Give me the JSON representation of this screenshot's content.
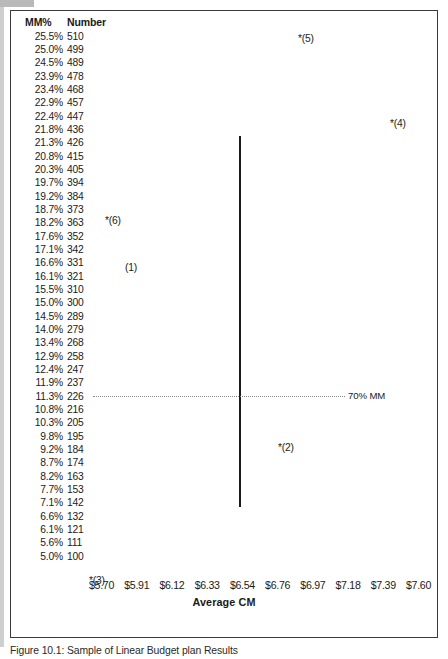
{
  "figure": {
    "caption": "Figure 10.1: Sample of Linear Budget plan Results",
    "axis": {
      "x_title": "Average CM",
      "x_ticks": [
        "$5.70",
        "$5.91",
        "$6.12",
        "$6.33",
        "$6.54",
        "$6.76",
        "$6.97",
        "$7.18",
        "$7.39",
        "$7.60"
      ],
      "x_min": 5.7,
      "x_max": 7.6
    },
    "reference_line": {
      "label": "70% MM",
      "at_mm_percent": "11.3%",
      "at_number": "226",
      "style": "dotted"
    },
    "range_bar": {
      "top_mm_percent": "21.3%",
      "top_number": "426",
      "bottom_mm_percent": "7.1%",
      "bottom_number": "142",
      "at_x_tick": "$6.54"
    }
  },
  "table": {
    "headers": {
      "mm_percent": "MM%",
      "number": "Number"
    },
    "rows": [
      {
        "mm": "25.5%",
        "num": "510"
      },
      {
        "mm": "25.0%",
        "num": "499"
      },
      {
        "mm": "24.5%",
        "num": "489"
      },
      {
        "mm": "23.9%",
        "num": "478"
      },
      {
        "mm": "23.4%",
        "num": "468"
      },
      {
        "mm": "22.9%",
        "num": "457"
      },
      {
        "mm": "22.4%",
        "num": "447"
      },
      {
        "mm": "21.8%",
        "num": "436"
      },
      {
        "mm": "21.3%",
        "num": "426"
      },
      {
        "mm": "20.8%",
        "num": "415"
      },
      {
        "mm": "20.3%",
        "num": "405"
      },
      {
        "mm": "19.7%",
        "num": "394"
      },
      {
        "mm": "19.2%",
        "num": "384"
      },
      {
        "mm": "18.7%",
        "num": "373"
      },
      {
        "mm": "18.2%",
        "num": "363"
      },
      {
        "mm": "17.6%",
        "num": "352"
      },
      {
        "mm": "17.1%",
        "num": "342"
      },
      {
        "mm": "16.6%",
        "num": "331"
      },
      {
        "mm": "16.1%",
        "num": "321"
      },
      {
        "mm": "15.5%",
        "num": "310"
      },
      {
        "mm": "15.0%",
        "num": "300"
      },
      {
        "mm": "14.5%",
        "num": "289"
      },
      {
        "mm": "14.0%",
        "num": "279"
      },
      {
        "mm": "13.4%",
        "num": "268"
      },
      {
        "mm": "12.9%",
        "num": "258"
      },
      {
        "mm": "12.4%",
        "num": "247"
      },
      {
        "mm": "11.9%",
        "num": "237"
      },
      {
        "mm": "11.3%",
        "num": "226"
      },
      {
        "mm": "10.8%",
        "num": "216"
      },
      {
        "mm": "10.3%",
        "num": "205"
      },
      {
        "mm": "9.8%",
        "num": "195"
      },
      {
        "mm": "9.2%",
        "num": "184"
      },
      {
        "mm": "8.7%",
        "num": "174"
      },
      {
        "mm": "8.2%",
        "num": "163"
      },
      {
        "mm": "7.7%",
        "num": "153"
      },
      {
        "mm": "7.1%",
        "num": "142"
      },
      {
        "mm": "6.6%",
        "num": "132"
      },
      {
        "mm": "6.1%",
        "num": "121"
      },
      {
        "mm": "5.6%",
        "num": "111"
      },
      {
        "mm": "5.0%",
        "num": "100"
      }
    ]
  },
  "markers": [
    {
      "id": "m5",
      "label": "*(5)",
      "x": 297,
      "y": 32,
      "mm": "25.5%",
      "num": "510"
    },
    {
      "id": "m4",
      "label": "*(4)",
      "x": 389,
      "y": 117,
      "mm": "22.4%",
      "num": "447"
    },
    {
      "id": "m6",
      "label": "*(6)",
      "x": 104,
      "y": 214,
      "mm": "18.7%",
      "num": "373"
    },
    {
      "id": "m1",
      "label": "(1)",
      "x": 124,
      "y": 261,
      "mm": "17.1%",
      "num": "342"
    },
    {
      "id": "m2",
      "label": "*(2)",
      "x": 277,
      "y": 441,
      "mm": "10.3%",
      "num": "205"
    },
    {
      "id": "m3",
      "label": "*(3)",
      "x": 88,
      "y": 574,
      "mm": "5.0%",
      "num": "100"
    }
  ],
  "chart_data": {
    "type": "scatter",
    "title": "",
    "xlabel": "Average CM",
    "ylabel": "MM% / Number",
    "xlim": [
      5.7,
      7.6
    ],
    "grid": false,
    "legend": null,
    "x_tick_labels": [
      "$5.70",
      "$5.91",
      "$6.12",
      "$6.33",
      "$6.54",
      "$6.76",
      "$6.97",
      "$7.18",
      "$7.39",
      "$7.60"
    ],
    "y_tick_labels_mm": [
      "25.5%",
      "25.0%",
      "24.5%",
      "23.9%",
      "23.4%",
      "22.9%",
      "22.4%",
      "21.8%",
      "21.3%",
      "20.8%",
      "20.3%",
      "19.7%",
      "19.2%",
      "18.7%",
      "18.2%",
      "17.6%",
      "17.1%",
      "16.6%",
      "16.1%",
      "15.5%",
      "15.0%",
      "14.5%",
      "14.0%",
      "13.4%",
      "12.9%",
      "12.4%",
      "11.9%",
      "11.3%",
      "10.8%",
      "10.3%",
      "9.8%",
      "9.2%",
      "8.7%",
      "8.2%",
      "7.7%",
      "7.1%",
      "6.6%",
      "6.1%",
      "5.6%",
      "5.0%"
    ],
    "y_tick_labels_number": [
      510,
      499,
      489,
      478,
      468,
      457,
      447,
      436,
      426,
      415,
      405,
      394,
      384,
      373,
      363,
      352,
      342,
      331,
      321,
      310,
      300,
      289,
      279,
      268,
      258,
      247,
      237,
      226,
      216,
      205,
      195,
      184,
      174,
      163,
      153,
      142,
      132,
      121,
      111,
      100
    ],
    "points": [
      {
        "label": "*(5)",
        "x": 6.93,
        "mm_percent": 25.5,
        "number": 510
      },
      {
        "label": "*(4)",
        "x": 7.4,
        "mm_percent": 22.4,
        "number": 447
      },
      {
        "label": "*(6)",
        "x": 5.92,
        "mm_percent": 18.7,
        "number": 373
      },
      {
        "label": "(1)",
        "x": 6.03,
        "mm_percent": 17.1,
        "number": 342
      },
      {
        "label": "*(2)",
        "x": 6.83,
        "mm_percent": 10.3,
        "number": 205
      },
      {
        "label": "*(3)",
        "x": 5.84,
        "mm_percent": 5.0,
        "number": 100
      }
    ],
    "annotations": [
      {
        "type": "vline",
        "label": "range-bar",
        "x": 6.54,
        "mm_from": 21.3,
        "mm_to": 7.1,
        "number_from": 426,
        "number_to": 142
      },
      {
        "type": "hline",
        "label": "70% MM",
        "mm_percent": 11.3,
        "number": 226,
        "style": "dotted"
      }
    ]
  }
}
